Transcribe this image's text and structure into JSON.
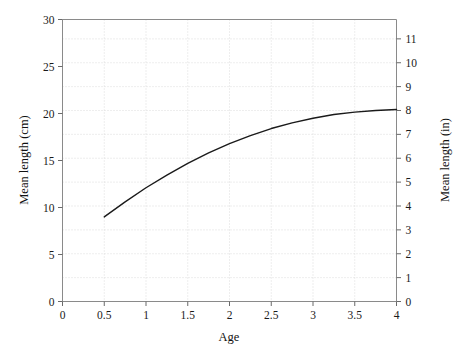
{
  "chart_data": {
    "type": "line",
    "title": "",
    "subtitle": "",
    "xlabel": "Age",
    "ylabel": "Mean length (cm)",
    "ylabel_secondary": "Mean length (in)",
    "xlim": [
      0,
      4
    ],
    "ylim": [
      0,
      30
    ],
    "ylim_secondary": [
      0,
      11.811
    ],
    "xticks": [
      0,
      0.5,
      1,
      1.5,
      2,
      2.5,
      3,
      3.5,
      4
    ],
    "xticklabels": [
      "0",
      "0.5",
      "1",
      "1.5",
      "2",
      "2.5",
      "3",
      "3.5",
      "4"
    ],
    "yticks": [
      0,
      5,
      10,
      15,
      20,
      25,
      30
    ],
    "yticklabels": [
      "0",
      "5",
      "10",
      "15",
      "20",
      "25",
      "30"
    ],
    "yticks_secondary": [
      0,
      1,
      2,
      3,
      4,
      5,
      6,
      7,
      8,
      9,
      10,
      11
    ],
    "yticklabels_secondary": [
      "0",
      "1",
      "2",
      "3",
      "4",
      "5",
      "6",
      "7",
      "8",
      "9",
      "10",
      "11"
    ],
    "grid": true,
    "grid_style": "dotted",
    "grid_color": "#d8d8d8",
    "legend": null,
    "line_color": "#1a1a1a",
    "line_width": 1.4,
    "series": [
      {
        "name": "Mean length",
        "x": [
          0.5,
          0.75,
          1.0,
          1.25,
          1.5,
          1.75,
          2.0,
          2.25,
          2.5,
          2.75,
          3.0,
          3.25,
          3.5,
          3.75,
          4.0
        ],
        "y": [
          9.0,
          10.6,
          12.1,
          13.45,
          14.7,
          15.8,
          16.8,
          17.65,
          18.4,
          19.0,
          19.5,
          19.9,
          20.15,
          20.32,
          20.42
        ]
      }
    ],
    "annotations": []
  }
}
